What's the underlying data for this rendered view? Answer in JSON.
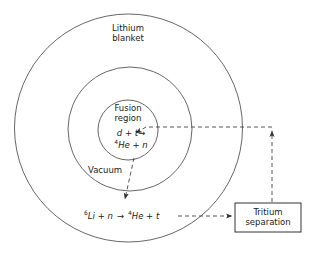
{
  "figure": {
    "type": "diagram",
    "background_color": "#ffffff",
    "line_color": "#333333",
    "text_color": "#1a1a1a"
  },
  "regions": {
    "outer": {
      "label_line1": "Lithium",
      "label_line2": "blanket",
      "cx": 128.5,
      "cy": 128,
      "r": 114
    },
    "middle": {
      "label": "Vacuum",
      "cx": 130,
      "cy": 129,
      "r": 62
    },
    "inner": {
      "label_line1": "Fusion",
      "label_line2": "region",
      "cx": 128,
      "cy": 130,
      "r": 30
    }
  },
  "reactions": {
    "fusion": {
      "reactants": "d + t",
      "arrow": "→",
      "products_sup": "4",
      "products_rest": "He + n",
      "full_text": "d + t → 4He + n"
    },
    "breeding": {
      "reactant_sup": "6",
      "reactant_rest": "Li + n",
      "arrow": "→",
      "product_sup": "4",
      "product_rest": "He + t",
      "full_text": "6Li + n → 4He + t"
    }
  },
  "box": {
    "label_line1": "Tritium",
    "label_line2": "separation",
    "x": 235,
    "y": 203,
    "width": 66,
    "height": 29
  },
  "flows": [
    {
      "name": "neutron-to-blanket",
      "style": "dashed",
      "from": "fusion-region",
      "to": "breeding-reaction",
      "arrowhead": "down"
    },
    {
      "name": "tritium-to-separation",
      "style": "dashed",
      "from": "breeding-reaction",
      "to": "tritium-separation-box",
      "arrowhead": "right"
    },
    {
      "name": "tritium-return-riser",
      "style": "dashed",
      "from": "tritium-separation-box",
      "to": "return-corner",
      "arrowhead": "up"
    },
    {
      "name": "tritium-return-to-fusion",
      "style": "dashed",
      "from": "return-corner",
      "to": "fusion-region",
      "arrowhead": "left"
    }
  ]
}
